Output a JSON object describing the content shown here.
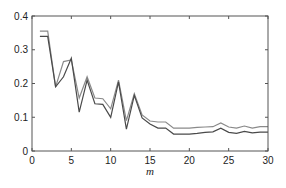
{
  "chart_data": {
    "type": "line",
    "title": "",
    "xlabel": "m",
    "ylabel": "",
    "xlim": [
      0,
      30
    ],
    "ylim": [
      0,
      0.4
    ],
    "xticks": [
      0,
      5,
      10,
      15,
      20,
      25,
      30
    ],
    "yticks": [
      0,
      0.1,
      0.2,
      0.3,
      0.4
    ],
    "ytick_labels": [
      "0",
      "0.1",
      "0.2",
      "0.3",
      "0.4"
    ],
    "xtick_labels": [
      "0",
      "5",
      "10",
      "15",
      "20",
      "25",
      "30"
    ],
    "grid": false,
    "legend": null,
    "x": [
      1,
      2,
      3,
      4,
      5,
      6,
      7,
      8,
      9,
      10,
      11,
      12,
      13,
      14,
      15,
      16,
      17,
      18,
      19,
      20,
      21,
      22,
      23,
      24,
      25,
      26,
      27,
      28,
      29,
      30
    ],
    "series": [
      {
        "name": "series-upper",
        "color": "#8a8a8a",
        "values": [
          0.355,
          0.355,
          0.19,
          0.265,
          0.27,
          0.157,
          0.22,
          0.157,
          0.155,
          0.125,
          0.21,
          0.09,
          0.17,
          0.107,
          0.089,
          0.086,
          0.086,
          0.068,
          0.068,
          0.068,
          0.07,
          0.071,
          0.072,
          0.083,
          0.071,
          0.068,
          0.074,
          0.068,
          0.072,
          0.072
        ]
      },
      {
        "name": "series-lower",
        "color": "#4a4a4a",
        "values": [
          0.34,
          0.34,
          0.19,
          0.22,
          0.275,
          0.115,
          0.21,
          0.14,
          0.138,
          0.1,
          0.205,
          0.065,
          0.165,
          0.098,
          0.08,
          0.068,
          0.068,
          0.05,
          0.05,
          0.05,
          0.052,
          0.055,
          0.057,
          0.068,
          0.055,
          0.052,
          0.058,
          0.054,
          0.056,
          0.056
        ]
      }
    ]
  },
  "plot": {
    "left": 32,
    "top": 16,
    "right": 268,
    "bottom": 151
  }
}
